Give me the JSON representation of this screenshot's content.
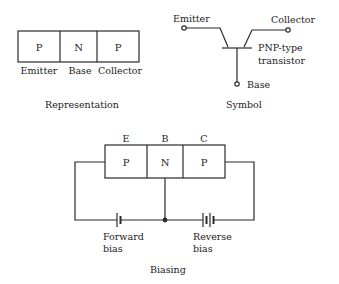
{
  "representation": {
    "regions": [
      "P",
      "N",
      "P"
    ],
    "labels": [
      "Emitter",
      "Base",
      "Collector"
    ],
    "caption": "Representation"
  },
  "symbol": {
    "emitter_label": "Emitter",
    "collector_label": "Collector",
    "base_label": "Base",
    "type_line1": "PNP-type",
    "type_line2": "transistor",
    "caption": "Symbol"
  },
  "biasing": {
    "terminals": [
      "E",
      "B",
      "C"
    ],
    "regions": [
      "P",
      "N",
      "P"
    ],
    "forward_line1": "Forward",
    "forward_line2": "bias",
    "reverse_line1": "Reverse",
    "reverse_line2": "bias",
    "caption": "Biasing"
  },
  "colors": {
    "line": "#2a2a2a",
    "background": "#ffffff"
  }
}
